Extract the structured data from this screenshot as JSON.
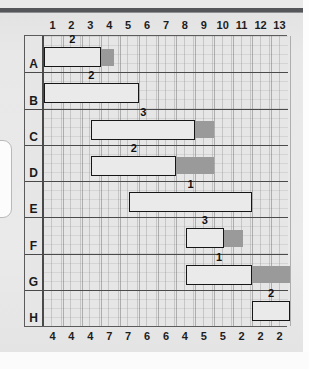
{
  "chart_data": {
    "type": "bar",
    "chart_kind": "gantt",
    "title": "",
    "xlabel": "",
    "ylabel": "",
    "xlim": [
      0,
      13
    ],
    "grid": true,
    "legend": null,
    "top_axis_label": "Time period",
    "top_axis_ticks": [
      "1",
      "2",
      "3",
      "4",
      "5",
      "6",
      "7",
      "8",
      "9",
      "10",
      "11",
      "12",
      "13"
    ],
    "bottom_axis_label": "Resource requirement per period",
    "bottom_axis_values": [
      "4",
      "4",
      "4",
      "7",
      "7",
      "6",
      "6",
      "4",
      "5",
      "5",
      "2",
      "2",
      "2"
    ],
    "categories": [
      "A",
      "B",
      "C",
      "D",
      "E",
      "F",
      "G",
      "H"
    ],
    "series": [
      {
        "name": "Activity duration (solid bar)",
        "values": [
          3,
          5,
          5.5,
          4.5,
          6.5,
          2,
          3.5,
          2
        ]
      },
      {
        "name": "Float / slack (shaded bar)",
        "values": [
          0.7,
          0,
          1,
          2,
          0,
          1,
          2,
          0
        ]
      }
    ],
    "tasks": [
      {
        "row": "A",
        "label": "2",
        "start": 0,
        "end": 3,
        "float_end": 3.7
      },
      {
        "row": "B",
        "label": "2",
        "start": 0,
        "end": 5,
        "float_end": 5
      },
      {
        "row": "C",
        "label": "3",
        "start": 2.5,
        "end": 8,
        "float_end": 9
      },
      {
        "row": "D",
        "label": "2",
        "start": 2.5,
        "end": 7,
        "float_end": 9
      },
      {
        "row": "E",
        "label": "1",
        "start": 4.5,
        "end": 11,
        "float_end": 11
      },
      {
        "row": "F",
        "label": "3",
        "start": 7.5,
        "end": 9.5,
        "float_end": 10.5
      },
      {
        "row": "G",
        "label": "1",
        "start": 7.5,
        "end": 11,
        "float_end": 13
      },
      {
        "row": "H",
        "label": "2",
        "start": 11,
        "end": 13,
        "float_end": 13
      }
    ],
    "colors": {
      "bar_fill": "#eaeaea",
      "bar_outline": "#161616",
      "float_fill": "#9a9a9a",
      "plot_background": "#e6e6e6",
      "frame": "#5b5b5b",
      "grid": "#969696",
      "text": "#1a1a1a"
    }
  }
}
